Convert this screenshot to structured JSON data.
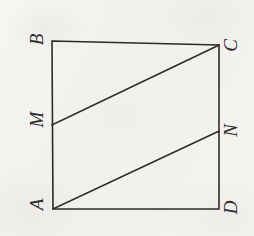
{
  "figure": {
    "kind": "geometry-diagram",
    "orientation_note": "labels rotated -90 degrees",
    "canvas": {
      "width": 254,
      "height": 236
    },
    "colors": {
      "background": "#f3f2ef",
      "stroke": "#2b2b2b",
      "label": "#2b2b2b"
    },
    "stroke_width": 1.6,
    "vertices": [
      {
        "id": "B",
        "label": "B",
        "x": 52,
        "y": 41,
        "label_x": 31,
        "label_y": 30
      },
      {
        "id": "C",
        "label": "C",
        "x": 219,
        "y": 45,
        "label_x": 224,
        "label_y": 36
      },
      {
        "id": "N",
        "label": "N",
        "x": 219,
        "y": 131,
        "label_x": 224,
        "label_y": 121
      },
      {
        "id": "D",
        "label": "D",
        "x": 219,
        "y": 209,
        "label_x": 224,
        "label_y": 198
      },
      {
        "id": "A",
        "label": "A",
        "x": 53,
        "y": 209,
        "label_x": 31,
        "label_y": 195
      },
      {
        "id": "M",
        "label": "M",
        "x": 52,
        "y": 125,
        "label_x": 29,
        "label_y": 110
      }
    ],
    "square_path": "M 52 41 L 219 45 L 219 209 L 53 209 Z",
    "segments": [
      {
        "id": "MC",
        "from": "M",
        "to": "C",
        "x1": 52,
        "y1": 125,
        "x2": 219,
        "y2": 45
      },
      {
        "id": "AN",
        "from": "A",
        "to": "N",
        "x1": 53,
        "y1": 209,
        "x2": 219,
        "y2": 131
      }
    ]
  }
}
